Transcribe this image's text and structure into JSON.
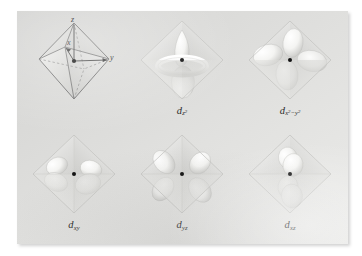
{
  "figure": {
    "background_color": "#ffffff",
    "panel_color": "#dedede",
    "title": ""
  },
  "axes_diagram": {
    "name": "reference-octahedron",
    "center_dot": true,
    "labels": [
      {
        "id": "z",
        "text": "z",
        "position": "top-vertex"
      },
      {
        "id": "x",
        "text": "x",
        "position": "front-vertex"
      },
      {
        "id": "y",
        "text": "y",
        "position": "right-vertex"
      }
    ]
  },
  "orbitals": [
    {
      "id": "d-z2",
      "caption_prefix": "d",
      "caption_sub": "z",
      "caption_sub_exp": "2",
      "caption_plain": "dz2",
      "shape": "two-vertical-lobes-with-torus",
      "lobe_count": 2
    },
    {
      "id": "d-x2-y2",
      "caption_prefix": "d",
      "caption_sub": "x",
      "caption_sub_exp": "2",
      "caption_sub_tail": "−y",
      "caption_sub_tail_exp": "2",
      "caption_plain": "dx2-y2",
      "shape": "four-lobes-along-axes",
      "lobe_count": 4
    },
    {
      "id": "d-xy",
      "caption_prefix": "d",
      "caption_sub": "xy",
      "caption_plain": "dxy",
      "shape": "four-lobes-between-axes",
      "lobe_count": 4
    },
    {
      "id": "d-yz",
      "caption_prefix": "d",
      "caption_sub": "yz",
      "caption_plain": "dyz",
      "shape": "four-lobes-between-axes",
      "lobe_count": 4
    },
    {
      "id": "d-xz",
      "caption_prefix": "d",
      "caption_sub": "xz",
      "caption_plain": "dxz",
      "shape": "four-lobes-between-axes-vertical-pair",
      "lobe_count": 4
    }
  ],
  "colors": {
    "octahedron_edge": "#6e6e6e",
    "octahedron_face": "#f2f2f0",
    "lobe_light": "#fdfdfc",
    "lobe_shadow": "#c9c9c6",
    "center_dot": "#111111",
    "caption_text": "#2a2a2a"
  }
}
